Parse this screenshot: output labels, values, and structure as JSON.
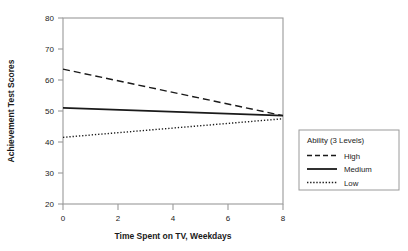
{
  "chart_data": {
    "type": "line",
    "title": "",
    "subtitle": "",
    "xlabel": "Time Spent on TV, Weekdays",
    "ylabel": "Achievement Test Scores",
    "xlim": [
      0,
      8
    ],
    "ylim": [
      20,
      80
    ],
    "xticks": [
      "0",
      "2",
      "4",
      "6",
      "8"
    ],
    "xtick_values": [
      0,
      2,
      4,
      6,
      8
    ],
    "yticks": [
      "20",
      "30",
      "40",
      "50",
      "60",
      "70",
      "80"
    ],
    "ytick_values": [
      20,
      30,
      40,
      50,
      60,
      70,
      80
    ],
    "grid": false,
    "legend_position": "right-outside",
    "legend_title": "Ability (3 Levels)",
    "x": [
      0,
      8
    ],
    "series": [
      {
        "name": "High",
        "style": "dashed",
        "color": "#1a1a1a",
        "values": [
          63.5,
          48.5
        ]
      },
      {
        "name": "Medium",
        "style": "solid",
        "color": "#1a1a1a",
        "values": [
          51.0,
          48.5
        ]
      },
      {
        "name": "Low",
        "style": "dotted",
        "color": "#1a1a1a",
        "values": [
          41.5,
          47.5
        ]
      }
    ]
  },
  "axes": {
    "x_title": "Time Spent on TV, Weekdays",
    "y_title": "Achievement Test Scores",
    "x_tick_labels": [
      "0",
      "2",
      "4",
      "6",
      "8"
    ],
    "y_tick_labels": [
      "20",
      "30",
      "40",
      "50",
      "60",
      "70",
      "80"
    ]
  },
  "legend": {
    "title": "Ability (3 Levels)",
    "entries": [
      {
        "label": "High",
        "style": "dashed"
      },
      {
        "label": "Medium",
        "style": "solid"
      },
      {
        "label": "Low",
        "style": "dotted"
      }
    ]
  },
  "colors": {
    "line": "#1a1a1a",
    "frame": "#9a9a9a",
    "text": "#1a1a1a",
    "background": "#ffffff"
  }
}
